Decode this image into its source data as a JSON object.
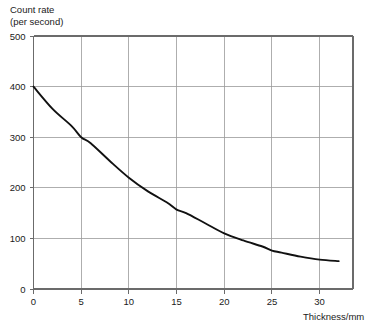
{
  "chart_data": {
    "type": "line",
    "title": "",
    "xlabel": "Thickness/mm",
    "ylabel_line1": "Count rate",
    "ylabel_line2": "(per second)",
    "xlim": [
      0,
      33.5
    ],
    "ylim": [
      0,
      500
    ],
    "xticks": [
      0,
      5,
      10,
      15,
      20,
      25,
      30
    ],
    "yticks": [
      0,
      100,
      200,
      300,
      400,
      500
    ],
    "xtick_labels": [
      "0",
      "5",
      "10",
      "15",
      "20",
      "25",
      "30"
    ],
    "ytick_labels": [
      "0",
      "100",
      "200",
      "300",
      "400",
      "500"
    ],
    "grid": true,
    "legend": "none",
    "series": [
      {
        "name": "count rate vs thickness",
        "x": [
          0,
          2,
          4,
          5,
          6,
          8,
          10,
          12,
          14,
          15,
          16,
          18,
          20,
          22,
          24,
          25,
          26,
          28,
          30,
          32
        ],
        "y": [
          400,
          356,
          322,
          300,
          288,
          253,
          220,
          193,
          171,
          157,
          150,
          130,
          110,
          96,
          84,
          76,
          72,
          64,
          58,
          55
        ]
      }
    ],
    "curve_color": "#111111",
    "grid_color": "#9a9a9a",
    "axis_color": "#6b6b6b",
    "background_color": "#ffffff"
  }
}
